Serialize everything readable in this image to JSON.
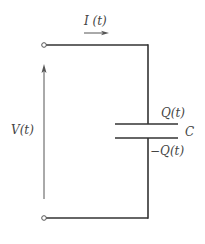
{
  "diagram": {
    "labels": {
      "current": "I (t)",
      "voltage": "V(t)",
      "charge_top": "Q(t)",
      "capacitance": "C",
      "charge_bottom": "−Q(t)"
    },
    "colors": {
      "wire": "#333333",
      "arrow": "#555555",
      "text": "#444444",
      "background": "#ffffff"
    },
    "components": [
      {
        "type": "terminal",
        "name": "top-terminal"
      },
      {
        "type": "terminal",
        "name": "bottom-terminal"
      },
      {
        "type": "capacitor",
        "name": "capacitor",
        "label": "C"
      },
      {
        "type": "current-arrow",
        "name": "current-arrow",
        "label": "I (t)"
      },
      {
        "type": "voltage-arrow",
        "name": "voltage-arrow",
        "label": "V(t)"
      }
    ]
  }
}
